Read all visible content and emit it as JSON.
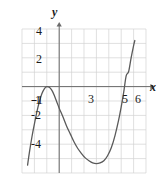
{
  "chart_data": {
    "type": "line",
    "title": "",
    "xlabel": "x",
    "ylabel": "y",
    "xlim": [
      -3,
      7
    ],
    "ylim": [
      -6,
      4
    ],
    "grid": true,
    "grid_step": 1,
    "legend": null,
    "axis_arrows": true,
    "x_tick_labels": [
      "-1",
      "3",
      "5",
      "6"
    ],
    "x_tick_values": [
      -1,
      3,
      5,
      6
    ],
    "y_tick_labels": [
      "4",
      "2",
      "-1",
      "-2",
      "-4"
    ],
    "y_tick_values": [
      4,
      2,
      -1,
      -2,
      -4
    ],
    "series": [
      {
        "name": "cubic curve",
        "color": "#5a5a5a",
        "x": [
          -2.55,
          -2.4,
          -2.2,
          -2.0,
          -1.8,
          -1.6,
          -1.4,
          -1.2,
          -1.0,
          -0.8,
          -0.6,
          -0.4,
          -0.2,
          0.0,
          0.3,
          0.6,
          0.9,
          1.2,
          1.5,
          1.8,
          2.1,
          2.4,
          2.7,
          3.0,
          3.3,
          3.6,
          3.9,
          4.2,
          4.5,
          4.8,
          5.0,
          5.2,
          5.4,
          5.6,
          5.8,
          6.0,
          6.1
        ],
        "y": [
          -5.45,
          -4.55,
          -3.5,
          -2.6,
          -1.75,
          -1.05,
          -0.5,
          -0.15,
          0.0,
          -0.05,
          -0.25,
          -0.6,
          -1.05,
          -1.5,
          -2.1,
          -2.75,
          -3.3,
          -3.85,
          -4.3,
          -4.65,
          -4.95,
          -5.15,
          -5.3,
          -5.35,
          -5.3,
          -5.15,
          -4.8,
          -4.25,
          -3.4,
          -2.3,
          -1.4,
          -0.4,
          0.75,
          1.05,
          2.0,
          2.85,
          3.2
        ]
      }
    ],
    "features": {
      "local_max": {
        "x": -1,
        "y": 0
      },
      "local_min": {
        "x": 3.45,
        "y": -5.35
      },
      "x_intercepts": [
        -1,
        5
      ]
    }
  },
  "axis_titles": {
    "x": "x",
    "y": "y"
  }
}
